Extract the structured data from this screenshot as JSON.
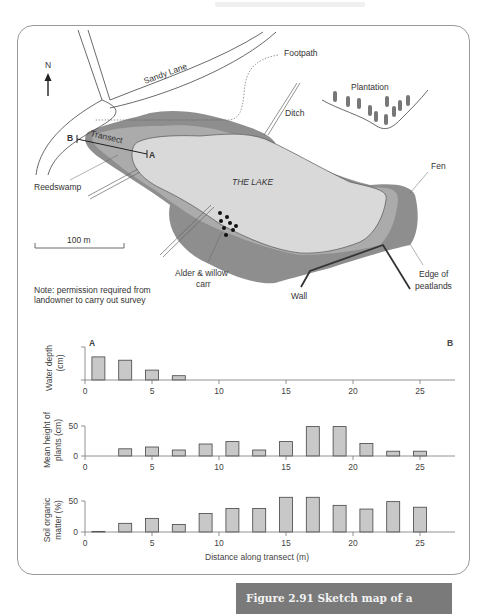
{
  "figure": {
    "caption": "Figure 2.91  Sketch map of a hydrosere",
    "caption_bg": "#7a7a7a"
  },
  "map": {
    "north_label": "N",
    "labels": {
      "sandy_lane": "Sandy Lane",
      "footpath": "Footpath",
      "ditch": "Ditch",
      "plantation": "Plantation",
      "transect": "Transect",
      "point_a": "A",
      "point_b": "B",
      "reedswamp": "Reedswamp",
      "lake": "THE LAKE",
      "fen": "Fen",
      "scale": "100 m",
      "alder_1": "Alder & willow",
      "alder_2": "carr",
      "wall": "Wall",
      "edge_1": "Edge of",
      "edge_2": "peatlands",
      "note_1": "Note: permission required from",
      "note_2": "landowner to carry out survey"
    },
    "colors": {
      "lake": "#d9d9d9",
      "reedswamp": "#ababab",
      "fen_carr": "#8e8e8e",
      "lines": "#333333"
    }
  },
  "chart_labels": {
    "water_ylabel_1": "Water depth",
    "water_ylabel_2": "(cm)",
    "plants_ylabel_1": "Mean height of",
    "plants_ylabel_2": "plants (cm)",
    "soil_ylabel_1": "Soil organic",
    "soil_ylabel_2": "matter (%)",
    "xlabel": "Distance along transect (m)",
    "end_a": "A",
    "end_b": "B",
    "xticks": [
      "0",
      "5",
      "10",
      "15",
      "20",
      "25"
    ],
    "y0": "0",
    "y50": "50"
  },
  "chart_data": [
    {
      "type": "bar",
      "title": "Water depth",
      "xlabel": "Distance along transect (m)",
      "ylabel": "Water depth (cm)",
      "x": [
        1,
        3,
        5,
        7
      ],
      "values": [
        70,
        60,
        30,
        13
      ],
      "value_note": "y-axis unlabeled; values relative to top tick = 100",
      "xlim": [
        0,
        27.5
      ],
      "annotations": [
        "A (at 0 m)",
        "B (at transect end)"
      ]
    },
    {
      "type": "bar",
      "title": "Mean height of plants",
      "xlabel": "Distance along transect (m)",
      "ylabel": "Mean height of plants (cm)",
      "x": [
        3,
        5,
        7,
        9,
        11,
        13,
        15,
        17,
        19,
        21,
        23,
        25
      ],
      "values": [
        12,
        15,
        10,
        20,
        24,
        10,
        24,
        49,
        49,
        21,
        8,
        8
      ],
      "ylim": [
        0,
        50
      ],
      "yticks": [
        0,
        50
      ],
      "xticks": [
        0,
        5,
        10,
        15,
        20,
        25
      ]
    },
    {
      "type": "bar",
      "title": "Soil organic matter",
      "xlabel": "Distance along transect (m)",
      "ylabel": "Soil organic matter (%)",
      "x": [
        1,
        3,
        5,
        7,
        9,
        11,
        13,
        15,
        17,
        19,
        21,
        23,
        25
      ],
      "values": [
        1,
        14,
        22,
        12,
        30,
        38,
        38,
        56,
        56,
        43,
        37,
        49,
        40
      ],
      "ylim": [
        0,
        50
      ],
      "yticks": [
        0,
        50
      ],
      "xticks": [
        0,
        5,
        10,
        15,
        20,
        25
      ]
    }
  ]
}
